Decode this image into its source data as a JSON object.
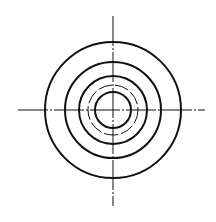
{
  "diagram": {
    "type": "concentric-circles-drawing",
    "background": "#ffffff",
    "stroke_color": "#111111",
    "center": {
      "x": 113,
      "y": 110
    },
    "circles": [
      {
        "r": 68,
        "width": 2.0,
        "style": "solid"
      },
      {
        "r": 48,
        "width": 2.0,
        "style": "solid"
      },
      {
        "r": 34,
        "width": 2.0,
        "style": "solid"
      },
      {
        "r": 25,
        "width": 1.0,
        "style": "dashed"
      },
      {
        "r": 18,
        "width": 2.0,
        "style": "solid"
      }
    ],
    "centerlines": {
      "horizontal": {
        "x1": 18,
        "x2": 205,
        "y": 110
      },
      "vertical": {
        "y1": 16,
        "y2": 206,
        "x": 113
      },
      "width": 1.0,
      "style": "dash-dot"
    }
  }
}
